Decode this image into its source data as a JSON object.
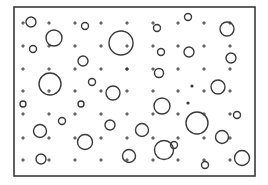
{
  "canvas": {
    "width": 268,
    "height": 185,
    "background": "#ffffff",
    "ink": "#3a3a3a"
  },
  "frame": {
    "x": 14,
    "y": 7,
    "width": 241,
    "height": 169
  },
  "grid": {
    "cols": [
      23,
      49,
      75,
      101,
      127,
      153,
      178,
      204,
      230
    ],
    "rows": [
      23,
      46,
      69,
      91,
      114,
      138,
      160
    ]
  },
  "dots": [
    {
      "cx": 127,
      "cy": 69,
      "r": 1.6
    },
    {
      "cx": 192,
      "cy": 86,
      "r": 1.6
    },
    {
      "cx": 188,
      "cy": 103,
      "r": 1.6
    }
  ],
  "circles": [
    {
      "cx": 31,
      "cy": 22,
      "r": 5
    },
    {
      "cx": 85,
      "cy": 26,
      "r": 3.5
    },
    {
      "cx": 157,
      "cy": 28,
      "r": 3.5
    },
    {
      "cx": 188,
      "cy": 17,
      "r": 3.5
    },
    {
      "cx": 227,
      "cy": 29,
      "r": 7
    },
    {
      "cx": 54,
      "cy": 38,
      "r": 8
    },
    {
      "cx": 121,
      "cy": 43,
      "r": 12
    },
    {
      "cx": 33,
      "cy": 49,
      "r": 3.5
    },
    {
      "cx": 161,
      "cy": 52,
      "r": 3.5
    },
    {
      "cx": 189,
      "cy": 52,
      "r": 5
    },
    {
      "cx": 231,
      "cy": 58,
      "r": 5
    },
    {
      "cx": 83,
      "cy": 61,
      "r": 5
    },
    {
      "cx": 159,
      "cy": 73,
      "r": 4.5
    },
    {
      "cx": 50,
      "cy": 84,
      "r": 11
    },
    {
      "cx": 92,
      "cy": 82,
      "r": 3.5
    },
    {
      "cx": 218,
      "cy": 87,
      "r": 7
    },
    {
      "cx": 113,
      "cy": 93,
      "r": 7
    },
    {
      "cx": 23,
      "cy": 104,
      "r": 3
    },
    {
      "cx": 81,
      "cy": 104,
      "r": 3
    },
    {
      "cx": 162,
      "cy": 106,
      "r": 8
    },
    {
      "cx": 237,
      "cy": 115,
      "r": 3.5
    },
    {
      "cx": 62,
      "cy": 121,
      "r": 3.5
    },
    {
      "cx": 110,
      "cy": 125,
      "r": 5
    },
    {
      "cx": 142,
      "cy": 130,
      "r": 6.5
    },
    {
      "cx": 40,
      "cy": 131,
      "r": 6.5
    },
    {
      "cx": 197,
      "cy": 123,
      "r": 11
    },
    {
      "cx": 174,
      "cy": 145,
      "r": 3.5
    },
    {
      "cx": 222,
      "cy": 137,
      "r": 6.5
    },
    {
      "cx": 85,
      "cy": 142,
      "r": 7.5
    },
    {
      "cx": 164,
      "cy": 150,
      "r": 9.5
    },
    {
      "cx": 129,
      "cy": 156,
      "r": 6.5
    },
    {
      "cx": 41,
      "cy": 159,
      "r": 5
    },
    {
      "cx": 242,
      "cy": 158,
      "r": 7.5
    },
    {
      "cx": 205,
      "cy": 165,
      "r": 3.5
    }
  ]
}
